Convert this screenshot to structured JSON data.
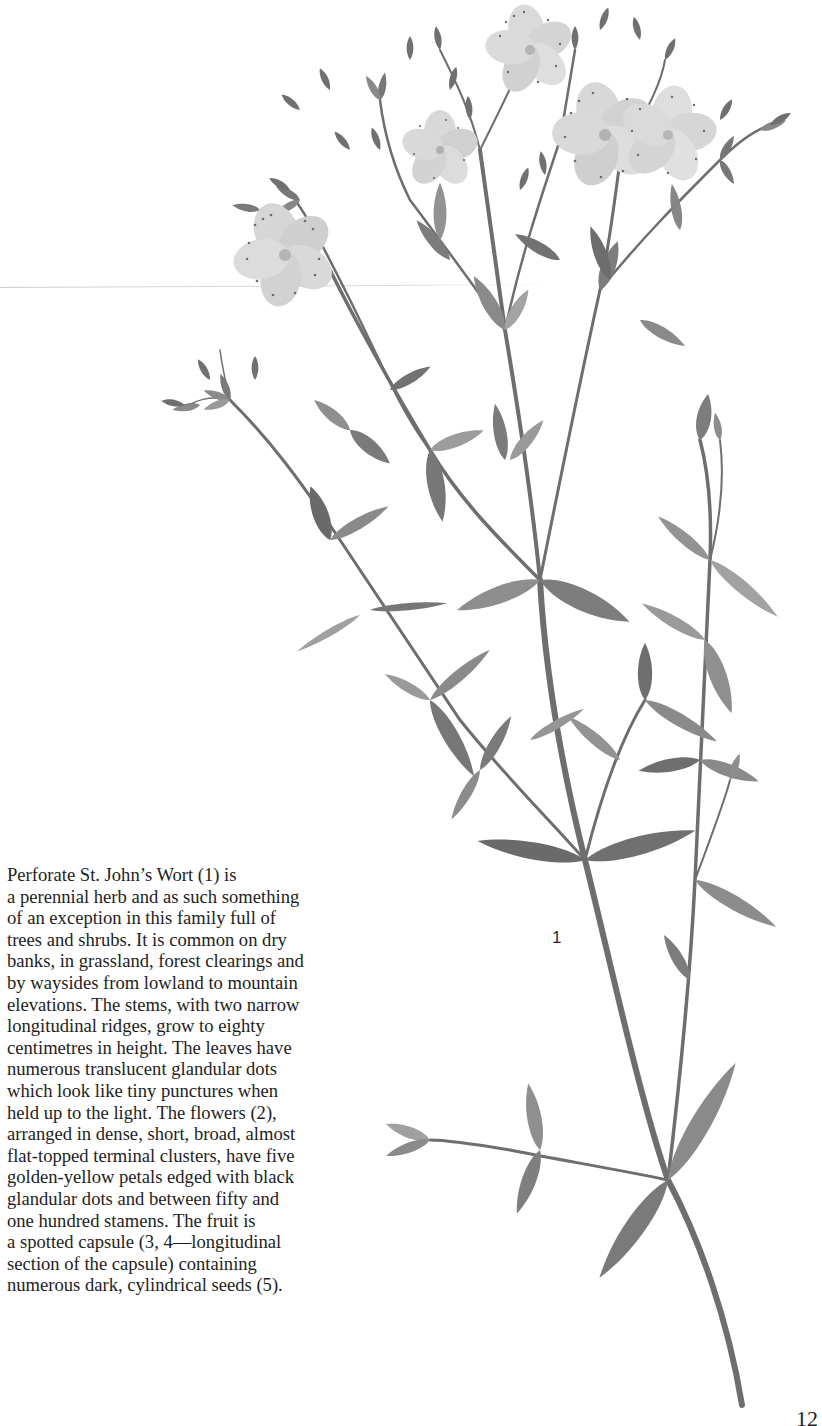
{
  "page": {
    "background": "#ffffff",
    "page_number": "12"
  },
  "illustration": {
    "subject": "Perforate St. John's Wort plant, grayscale watercolor",
    "figure_labels": [
      {
        "id": "fig-1",
        "text": "1"
      }
    ],
    "colors": {
      "stem": "#6e6e6e",
      "leaf_dark": "#6a6a6a",
      "leaf_mid": "#8a8a8a",
      "leaf_light": "#a9a9a9",
      "flower": "#d9d9d9",
      "flower_dots": "#6d6d6d"
    }
  },
  "text": {
    "lines": [
      "Perforate St. John’s Wort (1) is",
      "a perennial herb and as such something",
      "of an exception in this family full of",
      "trees and shrubs. It is common on dry",
      "banks, in grassland, forest clearings and",
      "by waysides from lowland to mountain",
      "elevations. The stems, with two narrow",
      "longitudinal ridges, grow to eighty",
      "centimetres in height. The leaves have",
      "numerous translucent glandular dots",
      "which look like tiny punctures when",
      "held up to the light. The flowers (2),",
      "arranged in dense, short, broad, almost",
      "flat-topped terminal clusters, have five",
      "golden-yellow petals edged with black",
      "glandular dots and between fifty and",
      "one hundred stamens. The fruit is",
      "a spotted capsule (3, 4—longitudinal",
      "section of the capsule) containing",
      "numerous dark, cylindrical seeds (5)."
    ]
  }
}
